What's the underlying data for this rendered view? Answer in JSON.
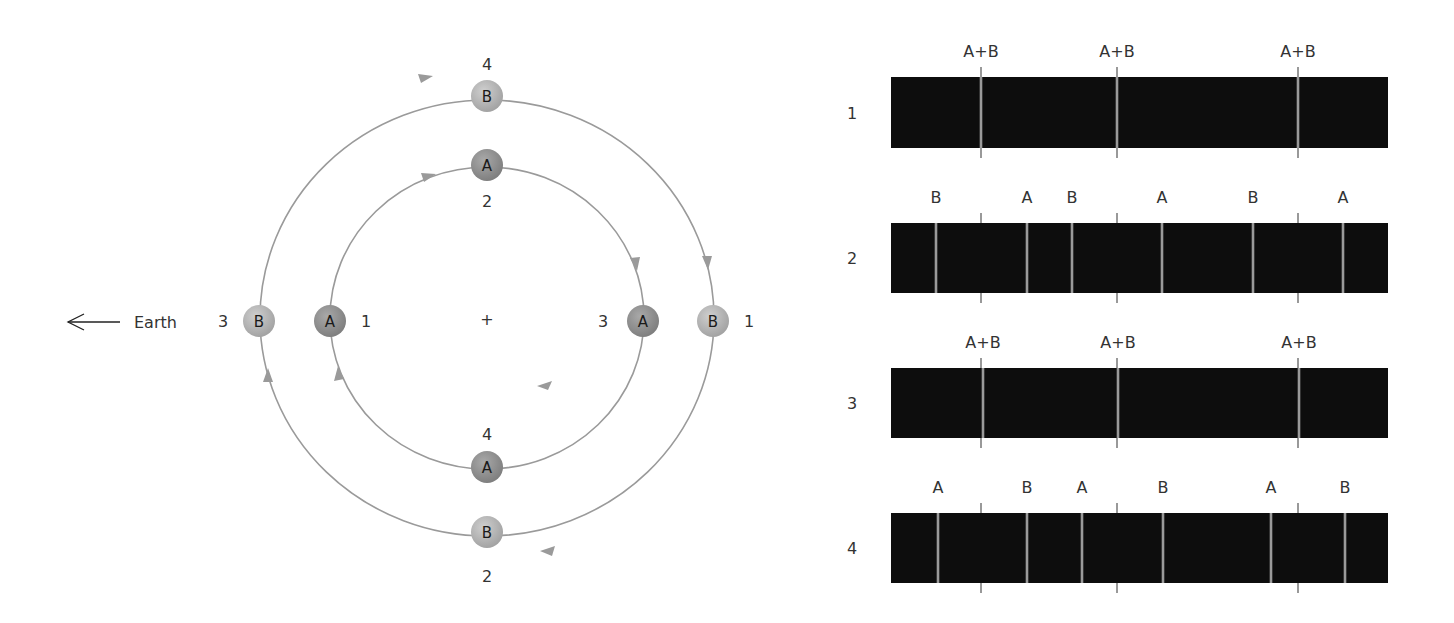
{
  "figure": {
    "earth_label": "Earth",
    "center_mark": "+",
    "colors": {
      "orbit": "#9a9a9a",
      "star_a": "#8f8f8f",
      "star_b": "#b5b5b5",
      "spectrum_bg": "#0d0d0d",
      "spectral_line": "#9a9a9a",
      "reference_tick": "#555555"
    },
    "orbit_diagram": {
      "center": [
        487,
        318
      ],
      "outer_orbit": {
        "star": "B",
        "rx": 227,
        "ry": 218
      },
      "inner_orbit": {
        "star": "A",
        "rx": 157,
        "ry": 151
      },
      "positions": [
        {
          "star": "B",
          "phase": "4",
          "x": 487,
          "y": 96,
          "label_x": 487,
          "label_y": 70
        },
        {
          "star": "A",
          "phase": "2",
          "x": 487,
          "y": 165,
          "label_x": 487,
          "label_y": 207
        },
        {
          "star": "B",
          "phase": "3",
          "x": 259,
          "y": 321,
          "label_x": 223,
          "label_y": 327
        },
        {
          "star": "A",
          "phase": "1",
          "x": 330,
          "y": 321,
          "label_x": 366,
          "label_y": 327
        },
        {
          "star": "A",
          "phase": "3",
          "x": 643,
          "y": 321,
          "label_x": 603,
          "label_y": 327
        },
        {
          "star": "B",
          "phase": "1",
          "x": 713,
          "y": 321,
          "label_x": 749,
          "label_y": 327
        },
        {
          "star": "A",
          "phase": "4",
          "x": 487,
          "y": 467,
          "label_x": 487,
          "label_y": 440
        },
        {
          "star": "B",
          "phase": "2",
          "x": 487,
          "y": 532,
          "label_x": 487,
          "label_y": 582
        }
      ]
    },
    "spectra": {
      "x_start": 891,
      "x_end": 1388,
      "reference_ticks_x": [
        981,
        1117,
        1298
      ],
      "rows": [
        {
          "label": "1",
          "y": 77,
          "height": 71,
          "lines": [
            {
              "x": 981,
              "label": "A+B"
            },
            {
              "x": 1117,
              "label": "A+B"
            },
            {
              "x": 1298,
              "label": "A+B"
            }
          ]
        },
        {
          "label": "2",
          "y": 223,
          "height": 70,
          "lines": [
            {
              "x": 936,
              "label": "B"
            },
            {
              "x": 1027,
              "label": "A"
            },
            {
              "x": 1072,
              "label": "B"
            },
            {
              "x": 1162,
              "label": "A"
            },
            {
              "x": 1253,
              "label": "B"
            },
            {
              "x": 1343,
              "label": "A"
            }
          ]
        },
        {
          "label": "3",
          "y": 368,
          "height": 70,
          "lines": [
            {
              "x": 983,
              "label": "A+B"
            },
            {
              "x": 1118,
              "label": "A+B"
            },
            {
              "x": 1299,
              "label": "A+B"
            }
          ]
        },
        {
          "label": "4",
          "y": 513,
          "height": 70,
          "lines": [
            {
              "x": 938,
              "label": "A"
            },
            {
              "x": 1027,
              "label": "B"
            },
            {
              "x": 1082,
              "label": "A"
            },
            {
              "x": 1163,
              "label": "B"
            },
            {
              "x": 1271,
              "label": "A"
            },
            {
              "x": 1345,
              "label": "B"
            }
          ]
        }
      ]
    }
  }
}
